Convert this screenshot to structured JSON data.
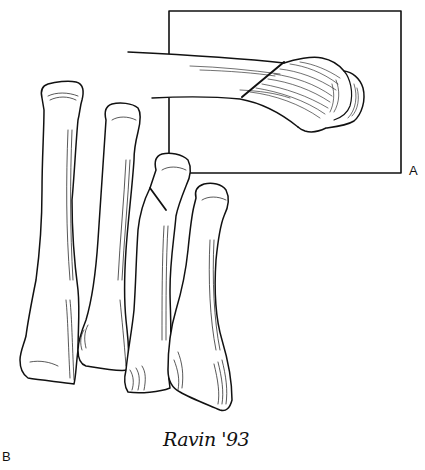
{
  "figure": {
    "type": "anatomical line illustration",
    "panels": [
      {
        "label": "A",
        "description": "inset box showing lateral view of metatarsal head with oblique osteotomy line"
      },
      {
        "label": "B",
        "description": "four metatarsal bones viewed from dorsal aspect, third bone with oblique osteotomy line below head"
      }
    ],
    "signature": "Ravin '93",
    "colors": {
      "line": "#111111",
      "background": "#ffffff"
    }
  },
  "labels": {
    "panel_a": "A",
    "panel_b": "B",
    "signature": "Ravin '93"
  }
}
